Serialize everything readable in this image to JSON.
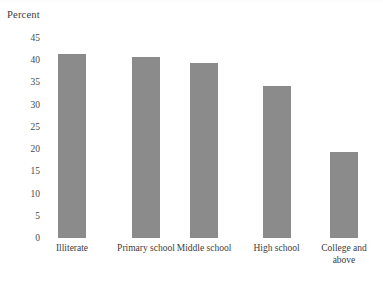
{
  "axis_title": "Percent",
  "colors": {
    "bar_fill": "#8b8b8b",
    "text": "#3c3c3c",
    "background": "#ffffff"
  },
  "chart_data": {
    "type": "bar",
    "title": "",
    "subtitle": "",
    "xlabel": "",
    "ylabel": "Percent",
    "categories": [
      "Illiterate",
      "Primary school",
      "Middle school",
      "High school",
      "College and\nabove"
    ],
    "values": [
      41.3,
      40.7,
      39.4,
      34.3,
      19.4
    ],
    "ylim": [
      0,
      45
    ],
    "yticks": [
      0,
      5,
      10,
      15,
      20,
      25,
      30,
      35,
      40,
      45
    ],
    "ytick_labels": [
      "0",
      "5",
      "10",
      "15",
      "20",
      "25",
      "30",
      "35",
      "40",
      "45"
    ],
    "grid": false,
    "legend": null,
    "legend_position": "none",
    "annotations": []
  }
}
